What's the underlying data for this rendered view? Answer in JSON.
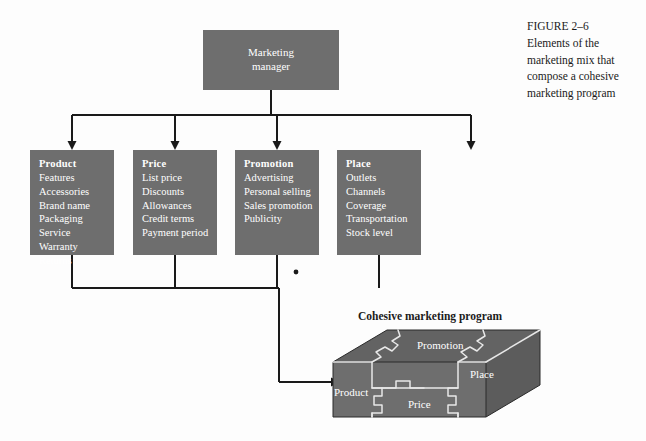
{
  "figure": {
    "caption_lines": [
      "FIGURE 2–6",
      "Elements of the",
      "marketing mix that",
      "compose a cohesive",
      "marketing program"
    ],
    "background_color": "#fdfdfd",
    "box_fill_color": "#6e6e6e",
    "box_text_color": "#ffffff",
    "line_color": "#1a1a1a"
  },
  "root": {
    "line1": "Marketing",
    "line2": "manager"
  },
  "columns": [
    {
      "id": "product",
      "heading": "Product",
      "items": [
        "Features",
        "Accessories",
        "Brand name",
        "Packaging",
        "Service",
        "Warranty",
        "Returns"
      ]
    },
    {
      "id": "price",
      "heading": "Price",
      "items": [
        "List price",
        "Discounts",
        "Allowances",
        "Credit terms",
        "Payment period"
      ]
    },
    {
      "id": "promotion",
      "heading": "Promotion",
      "items": [
        "Advertising",
        "Personal selling",
        "Sales promotion",
        "Publicity"
      ]
    },
    {
      "id": "place",
      "heading": "Place",
      "items": [
        "Outlets",
        "Channels",
        "Coverage",
        "Transportation",
        "Stock level"
      ]
    }
  ],
  "cube": {
    "title": "Cohesive marketing program",
    "faces": {
      "promotion": "Promotion",
      "place": "Place",
      "product": "Product",
      "price": "Price"
    }
  }
}
